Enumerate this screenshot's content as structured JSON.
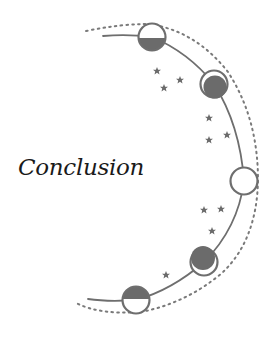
{
  "title": "Conclusion",
  "colors": {
    "line": "#6e6e6e",
    "fill": "#6b6b6b",
    "background": "#ffffff",
    "text": "#1a1a1a"
  },
  "decoration": {
    "arc": "crescent arc of moon phases with dotted outer arc",
    "moons": [
      {
        "phase": "half-lower-filled",
        "cx": 152,
        "cy": 37
      },
      {
        "phase": "waxing-crescent-filled",
        "cx": 214,
        "cy": 84
      },
      {
        "phase": "empty",
        "cx": 244,
        "cy": 181
      },
      {
        "phase": "waning-crescent-filled",
        "cx": 204,
        "cy": 262
      },
      {
        "phase": "half-upper-filled",
        "cx": 136,
        "cy": 300
      }
    ],
    "stars": [
      {
        "x": 157,
        "y": 71
      },
      {
        "x": 180,
        "y": 80
      },
      {
        "x": 164,
        "y": 88
      },
      {
        "x": 209,
        "y": 118
      },
      {
        "x": 227,
        "y": 135
      },
      {
        "x": 209,
        "y": 140
      },
      {
        "x": 204,
        "y": 210
      },
      {
        "x": 221,
        "y": 209
      },
      {
        "x": 212,
        "y": 231
      },
      {
        "x": 166,
        "y": 275
      }
    ]
  }
}
